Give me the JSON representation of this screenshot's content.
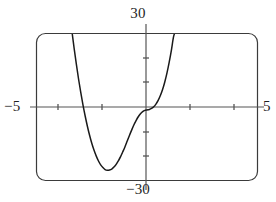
{
  "figure": {
    "kind": "graphing-calculator-plot",
    "background_color": "#ffffff",
    "frame_color": "#3b3b3b",
    "axis_color": "#4a4a4a",
    "curve_color": "#1a1a1a"
  },
  "labels": {
    "y_max": "30",
    "y_min": "−30",
    "x_min": "−5",
    "x_max": "5"
  },
  "chart_data": {
    "type": "line",
    "title": "",
    "xlabel": "",
    "ylabel": "",
    "xlim": [
      -5,
      5
    ],
    "ylim": [
      -30,
      30
    ],
    "grid": false,
    "legend": "none",
    "x_tick_labels": [
      "−5",
      "5"
    ],
    "y_tick_labels": [
      "−30",
      "30"
    ],
    "x_ticks": [
      -4,
      -3,
      -2,
      -1,
      1,
      2,
      3,
      4
    ],
    "y_ticks": [
      -20,
      -10,
      10,
      20
    ],
    "annotations": [
      "local minimum near x = −2.2, y = −26",
      "flat inflection near origin",
      "curve exits top of window at left and right"
    ],
    "series": [
      {
        "name": "curve",
        "x": [
          -3.35,
          -3.25,
          -3.15,
          -3.05,
          -2.95,
          -2.85,
          -2.75,
          -2.65,
          -2.55,
          -2.45,
          -2.35,
          -2.25,
          -2.15,
          -2.05,
          -1.95,
          -1.85,
          -1.75,
          -1.65,
          -1.55,
          -1.45,
          -1.35,
          -1.25,
          -1.15,
          -1.05,
          -0.95,
          -0.85,
          -0.75,
          -0.65,
          -0.55,
          -0.45,
          -0.35,
          -0.25,
          -0.15,
          -0.05,
          0.05,
          0.15,
          0.25,
          0.35,
          0.45,
          0.55,
          0.65,
          0.75,
          0.85,
          0.95,
          1.05,
          1.15,
          1.25,
          1.35
        ],
        "y": [
          31.0,
          24.0,
          17.5,
          11.4,
          5.9,
          0.8,
          -3.8,
          -8.0,
          -11.7,
          -15.0,
          -17.8,
          -20.2,
          -22.2,
          -23.8,
          -24.9,
          -25.7,
          -26.0,
          -25.9,
          -25.5,
          -24.7,
          -23.6,
          -22.1,
          -20.4,
          -18.4,
          -16.3,
          -14.0,
          -11.7,
          -9.5,
          -7.4,
          -5.6,
          -4.0,
          -2.8,
          -1.9,
          -1.4,
          -1.2,
          -1.0,
          -0.6,
          0.1,
          1.2,
          2.7,
          4.7,
          7.2,
          10.3,
          14.0,
          18.4,
          23.4,
          29.0,
          31.5
        ]
      }
    ]
  }
}
